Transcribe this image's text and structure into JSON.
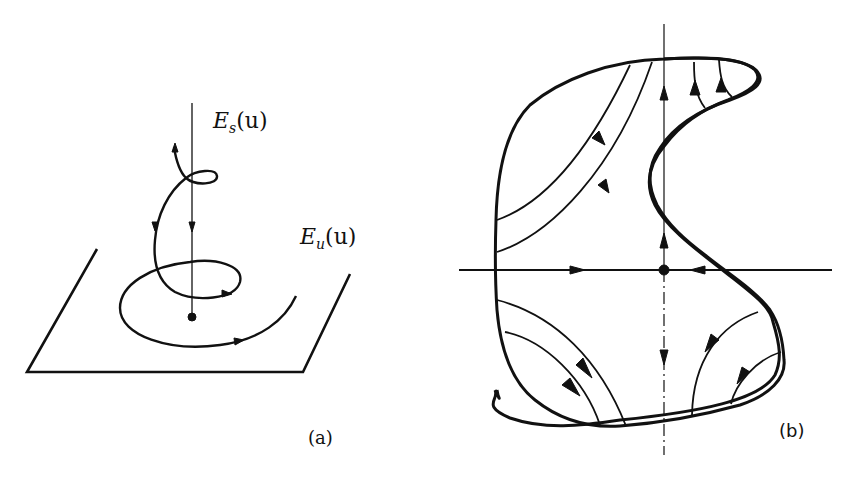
{
  "figure": {
    "panels": [
      {
        "id": "a",
        "caption": "(a)",
        "description": "3D spiral trajectory approaching a fixed point along stable manifold and spiraling in unstable plane",
        "labels": {
          "stable": {
            "main": "E",
            "sub": "s",
            "arg": "(u)"
          },
          "unstable": {
            "main": "E",
            "sub": "u",
            "arg": "(u)"
          }
        }
      },
      {
        "id": "b",
        "caption": "(b)",
        "description": "Planar phase portrait of a saddle point inside a kidney-shaped region with flow lines"
      }
    ],
    "colors": {
      "ink": "#111111",
      "background": "#ffffff"
    }
  }
}
